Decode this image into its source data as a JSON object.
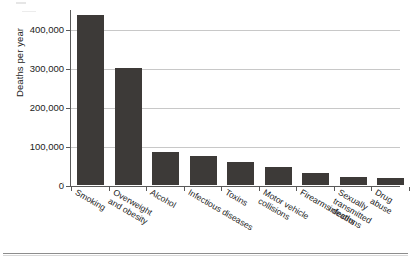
{
  "chart_data": {
    "type": "bar",
    "title": "",
    "xlabel": "",
    "ylabel": "Deaths per year",
    "ylim": [
      0,
      450000
    ],
    "grid": true,
    "legend": "none",
    "categories": [
      "Smoking",
      "Overweight and obesity",
      "Alcohol",
      "Infectious diseases",
      "Toxins",
      "Motor vehicle collisions",
      "Firearms deaths",
      "Sexually transmitted infections",
      "Drug abuse"
    ],
    "values": [
      435000,
      300000,
      85000,
      75000,
      60000,
      45000,
      30000,
      20000,
      17000
    ],
    "y_ticks": [
      0,
      100000,
      200000,
      300000,
      400000
    ],
    "y_tick_labels": [
      "0",
      "100,000",
      "200,000",
      "300,000",
      "400,000"
    ],
    "bar_color": "#3d3a38",
    "grid_color": "#c8c8c8",
    "axis_color": "#5a5a5a"
  },
  "axes": {
    "y_title": "Deaths per year"
  },
  "category_labels": [
    {
      "text": "Smoking"
    },
    {
      "text": "Overweight\nand obesity"
    },
    {
      "text": "Alcohol"
    },
    {
      "text": "Infectious diseases"
    },
    {
      "text": "Toxins"
    },
    {
      "text": "Motor vehicle\ncollisions"
    },
    {
      "text": "Firearms deaths"
    },
    {
      "text": "Sexually transmitted\ninfections"
    },
    {
      "text": "Drug abuse"
    }
  ],
  "y_tick_labels": [
    {
      "text": "0"
    },
    {
      "text": "100,000"
    },
    {
      "text": "200,000"
    },
    {
      "text": "300,000"
    },
    {
      "text": "400,000"
    }
  ]
}
